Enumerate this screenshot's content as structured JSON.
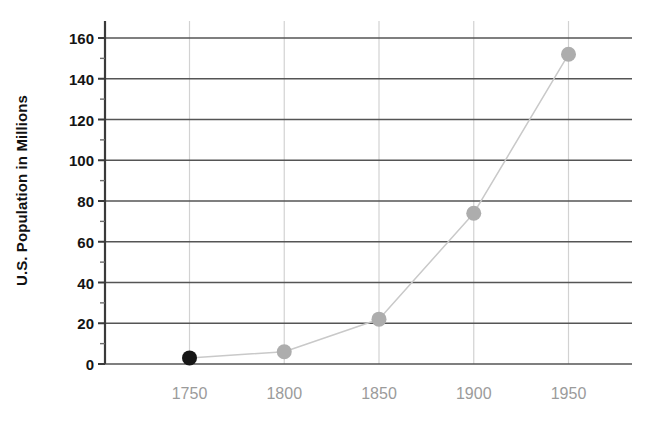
{
  "chart_data": {
    "type": "line",
    "title": "",
    "subtitle": "",
    "xlabel": "",
    "ylabel": "U.S. Population in Millions",
    "x": [
      1750,
      1800,
      1850,
      1900,
      1950
    ],
    "categories": [
      "1750",
      "1800",
      "1850",
      "1900",
      "1950"
    ],
    "values": [
      3,
      6,
      22,
      74,
      152
    ],
    "series": [
      {
        "name": "U.S. Population",
        "values": [
          3,
          6,
          22,
          74,
          152
        ]
      }
    ],
    "point_labels": [],
    "xlim": [
      1725,
      1975
    ],
    "ylim": [
      0,
      168
    ],
    "ytick_labels": [
      "0",
      "20",
      "40",
      "60",
      "80",
      "100",
      "120",
      "140",
      "160"
    ],
    "ytick_values": [
      0,
      20,
      40,
      60,
      80,
      100,
      120,
      140,
      160
    ],
    "yminor_tick_values": [
      10,
      30,
      50,
      70,
      90,
      110,
      130,
      150
    ],
    "xtick_labels": [
      "1750",
      "1800",
      "1850",
      "1900",
      "1950"
    ],
    "xtick_values": [
      1750,
      1800,
      1850,
      1900,
      1950
    ],
    "grid": "both",
    "grid_major_horizontal": true,
    "grid_vertical": true,
    "legend": "none",
    "legend_position": "none",
    "marker_colors": [
      "#161616",
      "#adadad",
      "#adadad",
      "#adadad",
      "#adadad"
    ],
    "highlighted_point_index": 0,
    "colors": {
      "line": "#c9c9c9",
      "marker_default": "#adadad",
      "marker_highlight": "#161616",
      "grid_horizontal": "#555555",
      "grid_vertical": "#d2d2d2",
      "axis_spine": "#3a3a3a",
      "ytick_text": "#141414",
      "xtick_text": "#9b9b9b",
      "ylabel_text": "#111111",
      "background": "#ffffff"
    }
  },
  "axes": {
    "y_title": "U.S. Population in Millions"
  }
}
